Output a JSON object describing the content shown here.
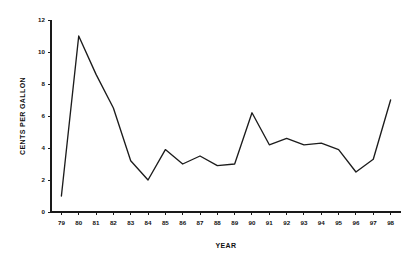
{
  "chart_data": {
    "type": "line",
    "title": "",
    "xlabel": "YEAR",
    "ylabel": "CENTS PER GALLON",
    "grid": false,
    "legend": false,
    "legend_position": "none",
    "line_color": "#1c1c1c",
    "axis_color": "#1a1a1a",
    "background": "#ffffff",
    "xlim": [
      78.4,
      98.6
    ],
    "ylim": [
      0,
      12
    ],
    "xticks": [
      "79",
      "80",
      "81",
      "82",
      "83",
      "84",
      "85",
      "86",
      "87",
      "88",
      "89",
      "90",
      "91",
      "92",
      "93",
      "94",
      "95",
      "96",
      "97",
      "98"
    ],
    "yticks": [
      "0",
      "2",
      "4",
      "6",
      "8",
      "10",
      "12"
    ],
    "categories": [
      "79",
      "80",
      "81",
      "82",
      "83",
      "84",
      "85",
      "86",
      "87",
      "88",
      "89",
      "90",
      "91",
      "92",
      "93",
      "94",
      "95",
      "96",
      "97",
      "98"
    ],
    "x": [
      79,
      80,
      81,
      82,
      83,
      84,
      85,
      86,
      87,
      88,
      89,
      90,
      91,
      92,
      93,
      94,
      95,
      96,
      97,
      98
    ],
    "values": [
      1.0,
      11.0,
      8.6,
      6.5,
      3.2,
      2.0,
      3.9,
      3.0,
      3.5,
      2.9,
      3.0,
      6.2,
      4.2,
      4.6,
      4.2,
      4.3,
      3.9,
      2.5,
      3.3,
      7.0
    ],
    "series": [
      {
        "name": "CENTS PER GALLON",
        "values": [
          1.0,
          11.0,
          8.6,
          6.5,
          3.2,
          2.0,
          3.9,
          3.0,
          3.5,
          2.9,
          3.0,
          6.2,
          4.2,
          4.6,
          4.2,
          4.3,
          3.9,
          2.5,
          3.3,
          7.0
        ]
      }
    ]
  }
}
